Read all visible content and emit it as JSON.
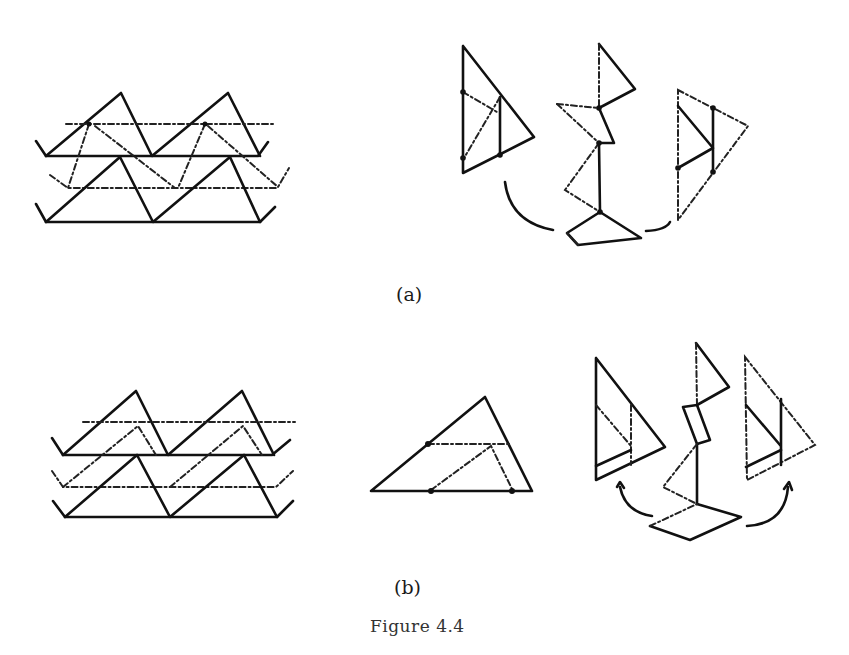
{
  "figure": {
    "caption": "Figure 4.4",
    "panels": [
      {
        "id": "a",
        "label": "(a)",
        "parts": [
          "stacked-triangle-lattice",
          "exploded-linkage"
        ]
      },
      {
        "id": "b",
        "label": "(b)",
        "parts": [
          "stacked-triangle-lattice",
          "single-triangle-with-inner-points",
          "exploded-linkage"
        ]
      }
    ]
  },
  "colors": {
    "ink": "#111111",
    "background": "#ffffff"
  }
}
